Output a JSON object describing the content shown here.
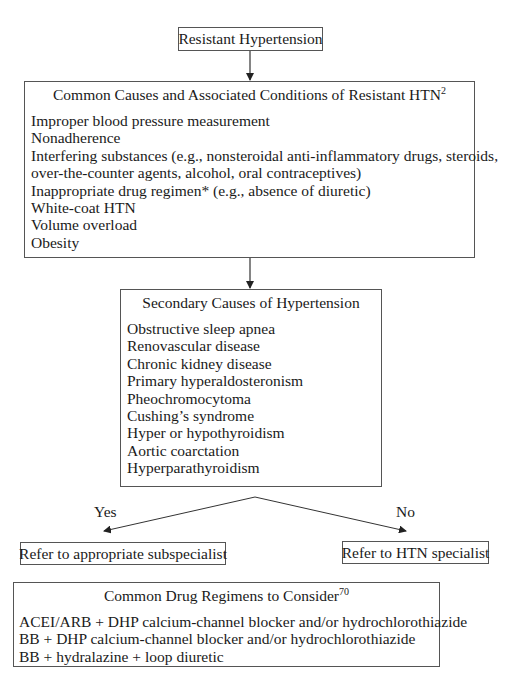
{
  "start": {
    "label": "Resistant Hypertension"
  },
  "common_causes": {
    "title": "Common Causes and Associated Conditions of Resistant HTN",
    "title_ref": "2",
    "items": [
      "Improper blood pressure measurement",
      "Nonadherence",
      "Interfering substances (e.g., nonsteroidal anti-inflammatory drugs, steroids,",
      "over-the-counter agents, alcohol, oral contraceptives)",
      "Inappropriate drug regimen* (e.g., absence of diuretic)",
      "White-coat HTN",
      "Volume overload",
      "Obesity"
    ]
  },
  "secondary_causes": {
    "title": "Secondary Causes of Hypertension",
    "items": [
      "Obstructive sleep apnea",
      "Renovascular disease",
      "Chronic kidney disease",
      "Primary hyperaldosteronism",
      "Pheochromocytoma",
      "Cushing’s syndrome",
      "Hyper or hypothyroidism",
      "Aortic coarctation",
      "Hyperparathyroidism"
    ]
  },
  "branches": {
    "yes_label": "Yes",
    "no_label": "No",
    "yes_outcome": "Refer to appropriate subspecialist",
    "no_outcome": "Refer to HTN specialist"
  },
  "drug_regimens": {
    "title": "Common Drug Regimens to Consider",
    "title_ref": "70",
    "items": [
      "ACEI/ARB + DHP calcium-channel blocker and/or hydrochlorothiazide",
      "BB + DHP calcium-channel blocker and/or hydrochlorothiazide",
      "BB + hydralazine + loop diuretic"
    ]
  },
  "colors": {
    "line": "#333333",
    "border": "#555555",
    "text": "#1a1a1a"
  }
}
